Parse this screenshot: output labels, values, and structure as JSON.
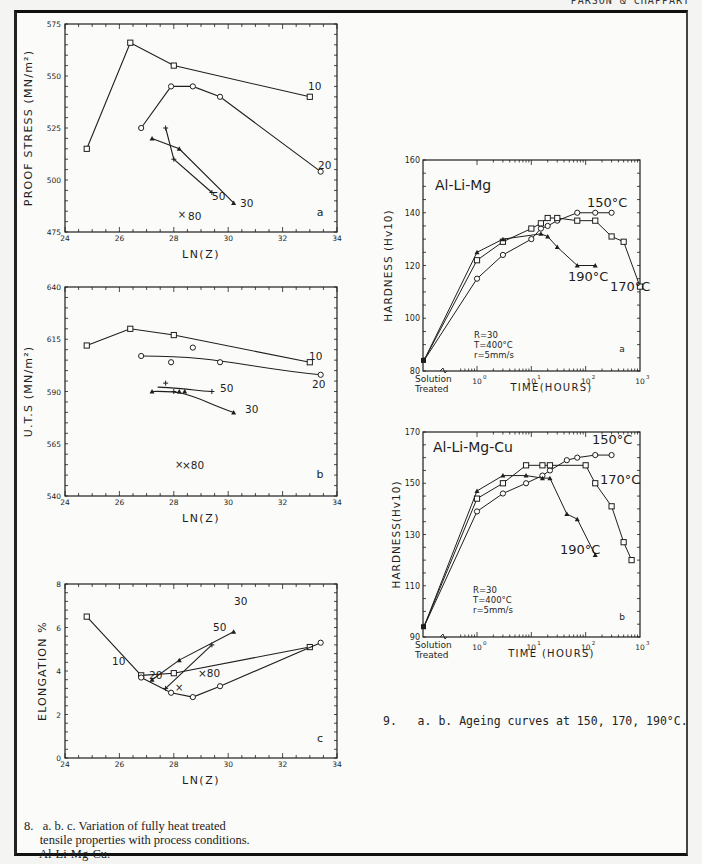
{
  "header": {
    "running_head": "PARSON & CHAPPART"
  },
  "captions": {
    "fig8_line1": "8.   a. b. c. Variation of fully heat treated",
    "fig8_line2": "     tensile properties with process conditions.",
    "fig8_line3": "     Al-Li-Mg-Cu.",
    "fig9": "9.   a. b. Ageing curves at 150, 170, 190°C."
  },
  "chart_data": [
    {
      "id": "fig8a",
      "type": "line",
      "title": "",
      "panel_label": "a",
      "xlabel": "LN(Z)",
      "ylabel": "PROOF STRESS (MN/m²)",
      "xlim": [
        24,
        34
      ],
      "ylim": [
        475,
        575
      ],
      "xticks": [
        24,
        26,
        28,
        30,
        32,
        34
      ],
      "yticks": [
        475,
        500,
        525,
        550,
        575
      ],
      "series": [
        {
          "name": "10",
          "marker": "square",
          "x": [
            24.8,
            26.4,
            28.0,
            33.0
          ],
          "y": [
            515,
            566,
            555,
            540
          ]
        },
        {
          "name": "20",
          "marker": "circle",
          "x": [
            26.8,
            27.9,
            28.7,
            29.7,
            33.4
          ],
          "y": [
            525,
            545,
            545,
            540,
            504
          ]
        },
        {
          "name": "30",
          "marker": "triangle",
          "x": [
            27.2,
            28.2,
            30.2
          ],
          "y": [
            520,
            515,
            489
          ]
        },
        {
          "name": "50",
          "marker": "plus",
          "x": [
            27.7,
            28.0,
            29.4
          ],
          "y": [
            525,
            510,
            494
          ]
        },
        {
          "name": "80",
          "marker": "cross",
          "x": [
            28.3
          ],
          "y": [
            483
          ]
        }
      ]
    },
    {
      "id": "fig8b",
      "type": "line",
      "panel_label": "b",
      "xlabel": "LN(Z)",
      "ylabel": "U.T.S (MN/m²)",
      "xlim": [
        24,
        34
      ],
      "ylim": [
        540,
        640
      ],
      "xticks": [
        24,
        26,
        28,
        30,
        32,
        34
      ],
      "yticks": [
        540,
        565,
        590,
        615,
        640
      ],
      "series": [
        {
          "name": "10",
          "marker": "square",
          "x": [
            24.8,
            26.4,
            28.0,
            33.0
          ],
          "y": [
            612,
            620,
            617,
            604
          ]
        },
        {
          "name": "20",
          "marker": "circle",
          "x": [
            26.8,
            27.9,
            28.7,
            29.7,
            33.4
          ],
          "y": [
            607,
            604,
            611,
            604,
            598
          ],
          "fit": "smooth"
        },
        {
          "name": "30",
          "marker": "triangle",
          "x": [
            27.2,
            28.2,
            28.4,
            30.2
          ],
          "y": [
            590,
            590,
            590,
            580
          ],
          "fit": "smooth"
        },
        {
          "name": "50",
          "marker": "plus",
          "x": [
            27.7,
            28.0,
            29.4
          ],
          "y": [
            594,
            590,
            590
          ],
          "fit": "smooth"
        },
        {
          "name": "80",
          "marker": "cross",
          "x": [
            28.2
          ],
          "y": [
            555
          ]
        }
      ]
    },
    {
      "id": "fig8c",
      "type": "line",
      "panel_label": "c",
      "xlabel": "LN(Z)",
      "ylabel": "ELONGATION %",
      "xlim": [
        24,
        34
      ],
      "ylim": [
        0,
        8
      ],
      "xticks": [
        24,
        26,
        28,
        30,
        32,
        34
      ],
      "yticks": [
        0,
        2,
        4,
        6,
        8
      ],
      "series": [
        {
          "name": "10",
          "marker": "square",
          "x": [
            24.8,
            26.8,
            28.0,
            33.0
          ],
          "y": [
            6.5,
            3.8,
            3.9,
            5.1
          ]
        },
        {
          "name": "20",
          "marker": "circle",
          "x": [
            26.8,
            27.9,
            28.7,
            29.7,
            33.4
          ],
          "y": [
            3.7,
            3.0,
            2.8,
            3.3,
            5.3
          ]
        },
        {
          "name": "30",
          "marker": "triangle",
          "x": [
            27.2,
            28.2,
            30.2
          ],
          "y": [
            3.6,
            4.5,
            5.8
          ]
        },
        {
          "name": "50",
          "marker": "plus",
          "x": [
            27.7,
            29.4
          ],
          "y": [
            3.2,
            5.2
          ]
        },
        {
          "name": "80",
          "marker": "cross",
          "x": [
            28.2
          ],
          "y": [
            3.2
          ]
        }
      ]
    },
    {
      "id": "fig9a",
      "type": "line",
      "title": "Al-Li-Mg",
      "panel_label": "a",
      "xlabel": "TIME(HOURS)",
      "ylabel": "HARDNESS (Hv10)",
      "xscale": "log",
      "x_first_label": "Solution Treated",
      "xticks": [
        "10^0",
        "10^1",
        "10^2",
        "10^3"
      ],
      "ylim": [
        80,
        160
      ],
      "yticks": [
        80,
        100,
        120,
        140,
        160
      ],
      "annotation": "R=30\nT=400°C\nr=5mm/s",
      "series": [
        {
          "name": "150°C",
          "marker": "circle",
          "x": [
            "ST",
            1,
            3,
            10,
            15,
            20,
            30,
            70,
            150,
            300
          ],
          "y": [
            84,
            115,
            124,
            130,
            134,
            135,
            137,
            140,
            140,
            140
          ]
        },
        {
          "name": "170°C",
          "marker": "square",
          "x": [
            "ST",
            1,
            3,
            10,
            15,
            20,
            30,
            70,
            150,
            300,
            500,
            1000
          ],
          "y": [
            84,
            122,
            129,
            134,
            136,
            138,
            138,
            137,
            137,
            131,
            129,
            112
          ]
        },
        {
          "name": "190°C",
          "marker": "triangle",
          "x": [
            "ST",
            1,
            3,
            15,
            20,
            30,
            70,
            150
          ],
          "y": [
            84,
            125,
            130,
            132,
            131,
            127,
            120,
            120
          ]
        }
      ]
    },
    {
      "id": "fig9b",
      "type": "line",
      "title": "Al-Li-Mg-Cu",
      "panel_label": "b",
      "xlabel": "TIME (HOURS)",
      "ylabel": "HARDNESS(Hv10)",
      "xscale": "log",
      "x_first_label": "Solution Treated",
      "xticks": [
        "10^0",
        "10^1",
        "10^2",
        "10^3"
      ],
      "ylim": [
        90,
        170
      ],
      "yticks": [
        90,
        110,
        130,
        150,
        170
      ],
      "annotation": "R=30\nT=400°C\nr=5mm/s",
      "series": [
        {
          "name": "150°C",
          "marker": "circle",
          "x": [
            "ST",
            1,
            3,
            8,
            16,
            22,
            45,
            70,
            150,
            300
          ],
          "y": [
            94,
            139,
            146,
            150,
            153,
            155,
            159,
            160,
            161,
            161
          ]
        },
        {
          "name": "170°C",
          "marker": "square",
          "x": [
            "ST",
            1,
            3,
            8,
            16,
            22,
            100,
            150,
            300,
            500,
            700
          ],
          "y": [
            94,
            144,
            150,
            157,
            157,
            157,
            157,
            150,
            141,
            127,
            120
          ]
        },
        {
          "name": "190°C",
          "marker": "triangle",
          "x": [
            "ST",
            1,
            3,
            8,
            16,
            22,
            45,
            70,
            150
          ],
          "y": [
            94,
            147,
            153,
            153,
            152,
            152,
            138,
            136,
            122
          ]
        }
      ]
    }
  ]
}
